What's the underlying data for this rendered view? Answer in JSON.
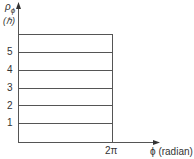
{
  "diagram": {
    "y_axis_label_symbol": "ρ",
    "y_axis_label_sub": "ϕ",
    "y_axis_unit": "(ℏ)",
    "x_axis_label": "ϕ (radian)",
    "x_tick_label": "2π",
    "y_tick_labels": [
      "1",
      "2",
      "3",
      "4",
      "5"
    ],
    "levels": [
      1,
      2,
      3,
      4,
      5,
      6
    ],
    "colors": {
      "line": "#555555",
      "background": "#ffffff"
    }
  }
}
